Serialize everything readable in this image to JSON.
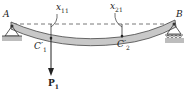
{
  "diagram": {
    "type": "simply-supported beam deflection",
    "labels": {
      "support_left": "A",
      "support_right": "B",
      "point1_name": "x",
      "point1_sub": "11",
      "point2_name": "x",
      "point2_sub": "21",
      "deflected1_name": "C′",
      "deflected1_sub": "1",
      "deflected2_name": "C′",
      "deflected2_sub": "2",
      "load_name": "P",
      "load_sub": "1"
    },
    "colors": {
      "beam_fill": "#c8c8c8",
      "beam_stroke": "#444444",
      "ground_fill": "#bdbdbd",
      "line": "#333333"
    }
  }
}
